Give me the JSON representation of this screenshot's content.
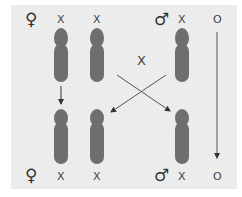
{
  "diagram": {
    "title": "",
    "type": "sex-linked inheritance (XX/XO)",
    "colors": {
      "panel": "#ececec",
      "chromosome": "#6e6e6e",
      "line": "#555555"
    },
    "parents": {
      "female_symbol": "♀",
      "male_symbol": "♂",
      "female_chromosomes": [
        "X",
        "X"
      ],
      "male_chromosomes": [
        "X",
        "O"
      ]
    },
    "cross_label": "X",
    "offspring": {
      "female_symbol": "♀",
      "male_symbol": "♂",
      "female_chromosomes": [
        "X",
        "X"
      ],
      "male_chromosomes": [
        "X",
        "O"
      ]
    }
  }
}
